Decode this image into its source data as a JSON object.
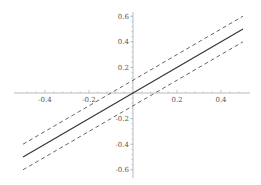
{
  "chart_data": {
    "type": "line",
    "title": "",
    "xlabel": "",
    "ylabel": "",
    "xlim": [
      -0.5,
      0.5
    ],
    "ylim": [
      -0.62,
      0.62
    ],
    "grid": false,
    "legend": null,
    "x_ticks": [
      -0.4,
      -0.2,
      0.2,
      0.4
    ],
    "x_tick_labels": [
      "-0.4",
      "-0.2",
      "0.2",
      "0.4"
    ],
    "y_ticks": [
      -0.6,
      -0.4,
      -0.2,
      0.2,
      0.4,
      0.6
    ],
    "y_tick_labels": [
      "-0.6",
      "-0.4",
      "-0.2",
      "0.2",
      "0.4",
      "0.6"
    ],
    "series": [
      {
        "name": "y = x",
        "style": "solid",
        "color": "#333333",
        "x": [
          -0.5,
          0.5
        ],
        "y": [
          -0.5,
          0.5
        ]
      },
      {
        "name": "y = x + 0.1",
        "style": "dashed",
        "color": "#555555",
        "x": [
          -0.5,
          0.5
        ],
        "y": [
          -0.4,
          0.6
        ]
      },
      {
        "name": "y = x - 0.1",
        "style": "dashed",
        "color": "#555555",
        "x": [
          -0.5,
          0.5
        ],
        "y": [
          -0.6,
          0.4
        ]
      }
    ]
  }
}
